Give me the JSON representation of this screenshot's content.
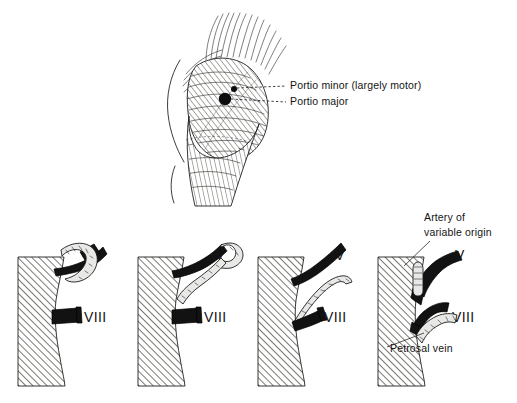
{
  "figure": {
    "background_color": "#ffffff",
    "ink_color": "#1a1a1a",
    "nerve_fill_color": "#121212",
    "vessel_fill_color": "#e8e8e6",
    "hatch_color": "#3a3a38"
  },
  "top_panel": {
    "name": "trigeminal-root-entry-zone",
    "labels": [
      {
        "id": "portio-minor",
        "text": "Portio minor (largely motor)",
        "x": 290,
        "y": 89,
        "leader_from_x": 286,
        "leader_from_y": 86,
        "leader_to_x": 236,
        "leader_to_y": 89
      },
      {
        "id": "portio-major",
        "text": "Portio major",
        "x": 290,
        "y": 105,
        "leader_from_x": 286,
        "leader_from_y": 102,
        "leader_to_x": 236,
        "leader_to_y": 99
      }
    ],
    "markers": [
      {
        "id": "portio-minor-dot",
        "cx": 234,
        "cy": 89,
        "r": 3.0
      },
      {
        "id": "portio-major-dot",
        "cx": 225,
        "cy": 99,
        "r": 6.2
      }
    ]
  },
  "bottom_row": {
    "name": "vascular-relationship-series",
    "panel_count": 4,
    "panels": [
      {
        "id": "panel-1",
        "index": 1,
        "origin_x": 14,
        "nerve_labels": [
          {
            "text": "V",
            "x": 95,
            "y": 260
          },
          {
            "text": "VIII",
            "x": 84,
            "y": 322
          }
        ],
        "description": "Vessel loops over and around cranial nerve V"
      },
      {
        "id": "panel-2",
        "index": 2,
        "origin_x": 134,
        "nerve_labels": [
          {
            "text": "V",
            "x": 215,
            "y": 260
          },
          {
            "text": "VIII",
            "x": 204,
            "y": 322
          }
        ],
        "description": "Vessel branches in a Y alongside cranial nerve V"
      },
      {
        "id": "panel-3",
        "index": 3,
        "origin_x": 254,
        "nerve_labels": [
          {
            "text": "V",
            "x": 335,
            "y": 260
          },
          {
            "text": "VIII",
            "x": 324,
            "y": 322
          }
        ],
        "description": "Vessel passes between cranial nerves V and VIII"
      },
      {
        "id": "panel-4",
        "index": 4,
        "origin_x": 374,
        "nerve_labels": [
          {
            "text": "V",
            "x": 455,
            "y": 260
          },
          {
            "text": "VIII",
            "x": 452,
            "y": 322
          }
        ],
        "description": "Artery of variable origin near V; petrosal vein accompanies VIII"
      }
    ],
    "callouts": [
      {
        "id": "artery-of-variable-origin",
        "line1": "Artery of",
        "line2": "variable origin",
        "x": 424,
        "y": 221,
        "leader_from_x": 430,
        "leader_from_y": 240,
        "leader_to_x": 404,
        "leader_to_y": 266
      },
      {
        "id": "petrosal-vein",
        "text": "Petrosal vein",
        "x": 390,
        "y": 352,
        "leader_from_x": 387,
        "leader_from_y": 348,
        "leader_to_x": 425,
        "leader_to_y": 334
      }
    ]
  }
}
